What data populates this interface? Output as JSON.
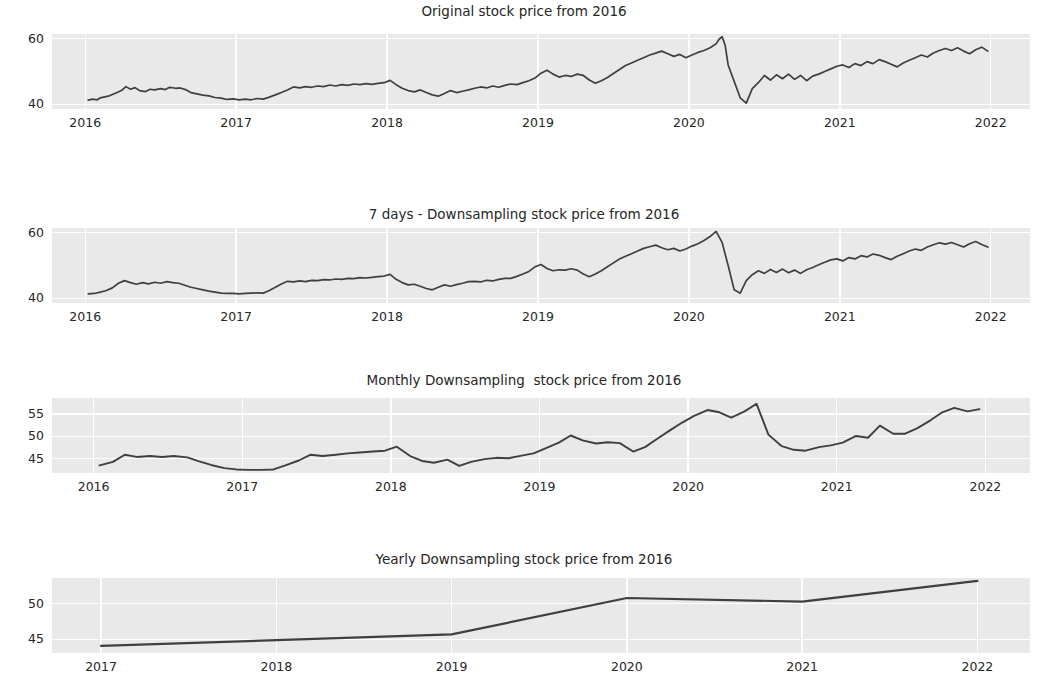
{
  "figure": {
    "background_color": "#ffffff",
    "plot_background_color": "#e9e9e9",
    "grid_color": "#fdfdfd",
    "line_color": "#3f3f3f",
    "text_color": "#262626"
  },
  "chart_data": [
    {
      "id": "original",
      "type": "line",
      "title": "Original stock price from 2016",
      "xlabel": "",
      "ylabel": "",
      "xlim": [
        2015.78,
        2022.26
      ],
      "ylim": [
        38.6,
        61.4
      ],
      "xticks": [
        2016,
        2017,
        2018,
        2019,
        2020,
        2021,
        2022
      ],
      "xticklabels": [
        "2016",
        "2017",
        "2018",
        "2019",
        "2020",
        "2021",
        "2022"
      ],
      "yticks": [
        40,
        60
      ],
      "yticklabels": [
        "40",
        "60"
      ],
      "grid": true,
      "legend": "none",
      "series": [
        {
          "name": "stock price",
          "x": [
            2016.02,
            2016.05,
            2016.08,
            2016.1,
            2016.13,
            2016.16,
            2016.2,
            2016.24,
            2016.27,
            2016.3,
            2016.33,
            2016.36,
            2016.4,
            2016.43,
            2016.46,
            2016.5,
            2016.53,
            2016.56,
            2016.6,
            2016.63,
            2016.67,
            2016.7,
            2016.74,
            2016.78,
            2016.82,
            2016.86,
            2016.9,
            2016.94,
            2016.98,
            2017.02,
            2017.06,
            2017.1,
            2017.14,
            2017.18,
            2017.22,
            2017.26,
            2017.3,
            2017.34,
            2017.38,
            2017.42,
            2017.46,
            2017.5,
            2017.54,
            2017.58,
            2017.62,
            2017.66,
            2017.7,
            2017.74,
            2017.78,
            2017.82,
            2017.86,
            2017.9,
            2017.94,
            2017.98,
            2018.02,
            2018.06,
            2018.1,
            2018.14,
            2018.18,
            2018.22,
            2018.26,
            2018.3,
            2018.34,
            2018.38,
            2018.42,
            2018.46,
            2018.5,
            2018.54,
            2018.58,
            2018.62,
            2018.66,
            2018.7,
            2018.74,
            2018.78,
            2018.82,
            2018.86,
            2018.9,
            2018.94,
            2018.98,
            2019.02,
            2019.06,
            2019.1,
            2019.14,
            2019.18,
            2019.22,
            2019.26,
            2019.3,
            2019.34,
            2019.38,
            2019.42,
            2019.46,
            2019.5,
            2019.54,
            2019.58,
            2019.62,
            2019.66,
            2019.7,
            2019.74,
            2019.78,
            2019.82,
            2019.86,
            2019.9,
            2019.94,
            2019.98,
            2020.02,
            2020.06,
            2020.1,
            2020.14,
            2020.18,
            2020.2,
            2020.22,
            2020.24,
            2020.26,
            2020.3,
            2020.34,
            2020.38,
            2020.42,
            2020.46,
            2020.5,
            2020.54,
            2020.58,
            2020.62,
            2020.66,
            2020.7,
            2020.74,
            2020.78,
            2020.82,
            2020.86,
            2020.9,
            2020.94,
            2020.98,
            2021.02,
            2021.06,
            2021.1,
            2021.14,
            2021.18,
            2021.22,
            2021.26,
            2021.3,
            2021.34,
            2021.38,
            2021.42,
            2021.46,
            2021.5,
            2021.54,
            2021.58,
            2021.62,
            2021.66,
            2021.7,
            2021.74,
            2021.78,
            2021.82,
            2021.86,
            2021.9,
            2021.94,
            2021.98
          ],
          "y": [
            41.3,
            41.6,
            41.4,
            42.0,
            42.3,
            42.6,
            43.4,
            44.2,
            45.4,
            44.6,
            45.1,
            44.2,
            43.9,
            44.6,
            44.4,
            44.8,
            44.5,
            45.2,
            44.9,
            45.0,
            44.4,
            43.6,
            43.2,
            42.8,
            42.6,
            42.1,
            41.9,
            41.5,
            41.7,
            41.4,
            41.6,
            41.4,
            41.8,
            41.6,
            42.2,
            42.9,
            43.6,
            44.4,
            45.3,
            45.0,
            45.4,
            45.2,
            45.6,
            45.4,
            45.9,
            45.6,
            46.0,
            45.8,
            46.2,
            46.0,
            46.3,
            46.1,
            46.4,
            46.6,
            47.3,
            46.0,
            44.9,
            44.2,
            43.8,
            44.4,
            43.6,
            42.9,
            42.5,
            43.3,
            44.2,
            43.6,
            44.0,
            44.4,
            44.9,
            45.3,
            45.0,
            45.6,
            45.2,
            45.8,
            46.2,
            46.0,
            46.6,
            47.2,
            48.0,
            49.5,
            50.4,
            49.2,
            48.3,
            48.8,
            48.5,
            49.2,
            48.8,
            47.4,
            46.4,
            47.2,
            48.2,
            49.4,
            50.6,
            51.8,
            52.6,
            53.4,
            54.2,
            55.0,
            55.6,
            56.2,
            55.4,
            54.6,
            55.2,
            54.2,
            55.0,
            55.8,
            56.4,
            57.2,
            58.4,
            59.8,
            60.6,
            58.0,
            52.0,
            47.0,
            42.0,
            40.4,
            44.8,
            46.6,
            48.8,
            47.4,
            49.0,
            47.8,
            49.2,
            47.6,
            48.8,
            47.2,
            48.6,
            49.2,
            50.0,
            50.8,
            51.6,
            52.0,
            51.2,
            52.4,
            51.8,
            53.0,
            52.4,
            53.6,
            53.0,
            52.2,
            51.4,
            52.6,
            53.4,
            54.2,
            55.0,
            54.4,
            55.6,
            56.4,
            57.0,
            56.4,
            57.2,
            56.2,
            55.4,
            56.6,
            57.4,
            56.2,
            55.2,
            56.4,
            57.6,
            59.8
          ]
        }
      ]
    },
    {
      "id": "weekly",
      "type": "line",
      "title": "7 days - Downsampling stock price from 2016",
      "xlabel": "",
      "ylabel": "",
      "xlim": [
        2015.78,
        2022.26
      ],
      "ylim": [
        38.6,
        61.4
      ],
      "xticks": [
        2016,
        2017,
        2018,
        2019,
        2020,
        2021,
        2022
      ],
      "xticklabels": [
        "2016",
        "2017",
        "2018",
        "2019",
        "2020",
        "2021",
        "2022"
      ],
      "yticks": [
        40,
        60
      ],
      "yticklabels": [
        "40",
        "60"
      ],
      "grid": true,
      "legend": "none",
      "series": [
        {
          "name": "stock price (7D mean)",
          "x": [
            2016.02,
            2016.06,
            2016.1,
            2016.14,
            2016.18,
            2016.22,
            2016.26,
            2016.3,
            2016.34,
            2016.38,
            2016.42,
            2016.46,
            2016.5,
            2016.54,
            2016.58,
            2016.62,
            2016.66,
            2016.7,
            2016.74,
            2016.78,
            2016.82,
            2016.86,
            2016.9,
            2016.94,
            2016.98,
            2017.02,
            2017.06,
            2017.1,
            2017.14,
            2017.18,
            2017.22,
            2017.26,
            2017.3,
            2017.34,
            2017.38,
            2017.42,
            2017.46,
            2017.5,
            2017.54,
            2017.58,
            2017.62,
            2017.66,
            2017.7,
            2017.74,
            2017.78,
            2017.82,
            2017.86,
            2017.9,
            2017.94,
            2017.98,
            2018.02,
            2018.06,
            2018.1,
            2018.14,
            2018.18,
            2018.22,
            2018.26,
            2018.3,
            2018.34,
            2018.38,
            2018.42,
            2018.46,
            2018.5,
            2018.54,
            2018.58,
            2018.62,
            2018.66,
            2018.7,
            2018.74,
            2018.78,
            2018.82,
            2018.86,
            2018.9,
            2018.94,
            2018.98,
            2019.02,
            2019.06,
            2019.1,
            2019.14,
            2019.18,
            2019.22,
            2019.26,
            2019.3,
            2019.34,
            2019.38,
            2019.42,
            2019.46,
            2019.5,
            2019.54,
            2019.58,
            2019.62,
            2019.66,
            2019.7,
            2019.74,
            2019.78,
            2019.82,
            2019.86,
            2019.9,
            2019.94,
            2019.98,
            2020.02,
            2020.06,
            2020.1,
            2020.14,
            2020.18,
            2020.22,
            2020.26,
            2020.3,
            2020.34,
            2020.38,
            2020.42,
            2020.46,
            2020.5,
            2020.54,
            2020.58,
            2020.62,
            2020.66,
            2020.7,
            2020.74,
            2020.78,
            2020.82,
            2020.86,
            2020.9,
            2020.94,
            2020.98,
            2021.02,
            2021.06,
            2021.1,
            2021.14,
            2021.18,
            2021.22,
            2021.26,
            2021.3,
            2021.34,
            2021.38,
            2021.42,
            2021.46,
            2021.5,
            2021.54,
            2021.58,
            2021.62,
            2021.66,
            2021.7,
            2021.74,
            2021.78,
            2021.82,
            2021.86,
            2021.9,
            2021.94,
            2021.98
          ],
          "y": [
            41.4,
            41.5,
            41.9,
            42.4,
            43.2,
            44.6,
            45.4,
            44.8,
            44.3,
            44.8,
            44.4,
            44.9,
            44.6,
            45.1,
            44.8,
            44.6,
            44.0,
            43.4,
            43.0,
            42.6,
            42.2,
            41.9,
            41.6,
            41.5,
            41.5,
            41.4,
            41.5,
            41.6,
            41.7,
            41.6,
            42.4,
            43.4,
            44.4,
            45.2,
            45.0,
            45.3,
            45.1,
            45.5,
            45.4,
            45.7,
            45.6,
            45.9,
            45.8,
            46.1,
            46.0,
            46.3,
            46.2,
            46.4,
            46.6,
            46.8,
            47.3,
            45.8,
            44.8,
            44.1,
            44.3,
            43.7,
            43.0,
            42.6,
            43.4,
            44.1,
            43.7,
            44.2,
            44.6,
            45.1,
            45.2,
            45.0,
            45.5,
            45.3,
            45.8,
            46.1,
            46.1,
            46.7,
            47.4,
            48.2,
            49.6,
            50.3,
            49.1,
            48.4,
            48.7,
            48.6,
            49.0,
            48.6,
            47.4,
            46.6,
            47.4,
            48.4,
            49.6,
            50.8,
            52.0,
            52.8,
            53.6,
            54.4,
            55.2,
            55.7,
            56.2,
            55.4,
            54.8,
            55.2,
            54.4,
            55.0,
            55.9,
            56.6,
            57.6,
            58.8,
            60.4,
            57.0,
            50.0,
            42.6,
            41.6,
            45.4,
            47.2,
            48.4,
            47.6,
            48.8,
            47.9,
            48.9,
            47.8,
            48.6,
            47.6,
            48.7,
            49.4,
            50.2,
            51.0,
            51.7,
            52.0,
            51.4,
            52.4,
            52.0,
            53.0,
            52.6,
            53.5,
            53.1,
            52.4,
            51.8,
            52.8,
            53.6,
            54.4,
            55.0,
            54.6,
            55.6,
            56.3,
            56.9,
            56.5,
            57.0,
            56.3,
            55.6,
            56.6,
            57.3,
            56.4,
            55.6,
            56.6,
            57.6,
            59.5
          ]
        }
      ]
    },
    {
      "id": "monthly",
      "type": "line",
      "title": "Monthly Downsampling  stock price from 2016",
      "xlabel": "",
      "ylabel": "",
      "xlim": [
        2015.72,
        2022.3
      ],
      "ylim": [
        41.8,
        58.6
      ],
      "xticks": [
        2016,
        2017,
        2018,
        2019,
        2020,
        2021,
        2022
      ],
      "xticklabels": [
        "2016",
        "2017",
        "2018",
        "2019",
        "2020",
        "2021",
        "2022"
      ],
      "yticks": [
        45,
        50,
        55
      ],
      "yticklabels": [
        "45",
        "50",
        "55"
      ],
      "grid": true,
      "legend": "none",
      "series": [
        {
          "name": "stock price (monthly mean)",
          "x": [
            2016.04,
            2016.13,
            2016.21,
            2016.29,
            2016.38,
            2016.46,
            2016.54,
            2016.63,
            2016.71,
            2016.79,
            2016.88,
            2016.96,
            2017.04,
            2017.13,
            2017.21,
            2017.29,
            2017.38,
            2017.46,
            2017.54,
            2017.63,
            2017.71,
            2017.79,
            2017.88,
            2017.96,
            2018.04,
            2018.13,
            2018.21,
            2018.29,
            2018.38,
            2018.46,
            2018.54,
            2018.63,
            2018.71,
            2018.79,
            2018.88,
            2018.96,
            2019.04,
            2019.13,
            2019.21,
            2019.29,
            2019.38,
            2019.46,
            2019.54,
            2019.63,
            2019.71,
            2019.79,
            2019.88,
            2019.96,
            2020.04,
            2020.13,
            2020.21,
            2020.29,
            2020.38,
            2020.46,
            2020.54,
            2020.63,
            2020.71,
            2020.79,
            2020.88,
            2020.96,
            2021.04,
            2021.13,
            2021.21,
            2021.29,
            2021.38,
            2021.46,
            2021.54,
            2021.63,
            2021.71,
            2021.79,
            2021.88,
            2021.96
          ],
          "y": [
            43.5,
            44.3,
            45.9,
            45.4,
            45.6,
            45.4,
            45.6,
            45.3,
            44.4,
            43.6,
            42.9,
            42.6,
            42.5,
            42.5,
            42.6,
            43.5,
            44.6,
            45.9,
            45.6,
            45.9,
            46.2,
            46.4,
            46.6,
            46.8,
            47.7,
            45.6,
            44.5,
            44.1,
            44.8,
            43.4,
            44.3,
            44.9,
            45.2,
            45.1,
            45.7,
            46.2,
            47.3,
            48.6,
            50.2,
            49.1,
            48.4,
            48.7,
            48.5,
            46.6,
            47.6,
            49.4,
            51.4,
            53.1,
            54.6,
            55.9,
            55.4,
            54.2,
            55.6,
            57.3,
            50.4,
            47.8,
            47.0,
            46.8,
            47.6,
            48.0,
            48.6,
            50.1,
            49.7,
            52.4,
            50.6,
            50.6,
            51.8,
            53.6,
            55.4,
            56.4,
            55.6,
            56.1
          ]
        }
      ]
    },
    {
      "id": "yearly",
      "type": "line",
      "title": "Yearly Downsampling stock price from 2016",
      "xlabel": "",
      "ylabel": "",
      "xlim": [
        2016.72,
        2022.3
      ],
      "ylim": [
        43.1,
        53.6
      ],
      "xticks": [
        2017,
        2018,
        2019,
        2020,
        2021,
        2022
      ],
      "xticklabels": [
        "2017",
        "2018",
        "2019",
        "2020",
        "2021",
        "2022"
      ],
      "yticks": [
        45,
        50
      ],
      "yticklabels": [
        "45",
        "50"
      ],
      "grid": true,
      "legend": "none",
      "series": [
        {
          "name": "stock price (yearly mean)",
          "x": [
            2017.0,
            2018.0,
            2019.0,
            2020.0,
            2021.0,
            2022.0
          ],
          "y": [
            44.1,
            44.9,
            45.7,
            50.8,
            50.3,
            53.2
          ]
        }
      ]
    }
  ]
}
